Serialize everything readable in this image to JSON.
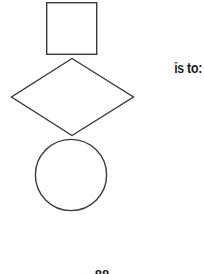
{
  "canvas": {
    "width": 204,
    "height": 274,
    "background_color": "#ffffff",
    "stroke_color": "#3a3a3a",
    "stroke_width": 1.4
  },
  "figure": {
    "name": "shape-sequence",
    "shapes": [
      {
        "name": "square",
        "type": "square",
        "x": 46,
        "y": 2,
        "width": 51,
        "height": 53,
        "fill": "none",
        "stroke": "#3a3a3a"
      },
      {
        "name": "diamond",
        "type": "diamond",
        "points": "72,58 134,97 72,136 11,97",
        "center_x": 72,
        "center_y": 97,
        "width": 123,
        "height": 78,
        "fill": "none",
        "stroke": "#3a3a3a"
      },
      {
        "name": "circle",
        "type": "circle",
        "center_x": 71,
        "center_y": 175,
        "radius": 36,
        "fill": "none",
        "stroke": "#3a3a3a"
      }
    ]
  },
  "relation": {
    "label": "is to:"
  },
  "footer": {
    "page_marker": "88"
  }
}
